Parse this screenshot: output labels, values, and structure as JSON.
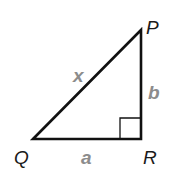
{
  "diagram": {
    "type": "right-triangle",
    "vertices": [
      {
        "id": "P",
        "label": "P",
        "x": 141,
        "y": 30
      },
      {
        "id": "Q",
        "label": "Q",
        "x": 33,
        "y": 139
      },
      {
        "id": "R",
        "label": "R",
        "x": 141,
        "y": 139
      }
    ],
    "sides": [
      {
        "from": "Q",
        "to": "P",
        "label": "x",
        "role": "hypotenuse"
      },
      {
        "from": "P",
        "to": "R",
        "label": "b",
        "role": "leg"
      },
      {
        "from": "Q",
        "to": "R",
        "label": "a",
        "role": "leg"
      }
    ],
    "right_angle_at": "R",
    "colors": {
      "stroke": "#111111",
      "vertex_label": "#1a1a1a",
      "side_label": "#8c8c8c"
    }
  }
}
